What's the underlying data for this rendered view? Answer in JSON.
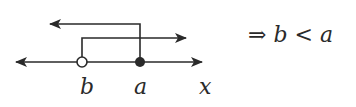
{
  "diagram": {
    "type": "number-line",
    "axis_label": "x",
    "points": [
      {
        "label": "b",
        "marker": "open-circle"
      },
      {
        "label": "a",
        "marker": "filled-circle"
      }
    ],
    "rays": [
      {
        "from": "a",
        "direction": "left",
        "level": "upper"
      },
      {
        "from": "b",
        "direction": "right",
        "level": "lower"
      }
    ]
  },
  "conclusion": {
    "arrow": "⇒",
    "left": "b",
    "relation": "<",
    "right": "a"
  }
}
